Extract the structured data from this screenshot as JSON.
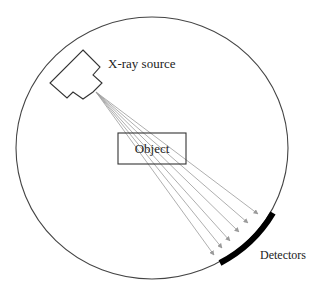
{
  "diagram": {
    "labels": {
      "source": "X-ray source",
      "object": "Object",
      "detectors": "Detectors"
    },
    "colors": {
      "outline": "#333333",
      "ray": "#9a9a9a",
      "detector": "#000000",
      "background": "#ffffff"
    },
    "gantry": {
      "cx": 152,
      "cy": 148,
      "rx": 136,
      "ry": 131
    },
    "source_origin": [
      96,
      92
    ],
    "ray_count": 6,
    "ray_endpoints": [
      [
        258,
        214
      ],
      [
        248,
        223
      ],
      [
        239,
        232
      ],
      [
        230,
        241
      ],
      [
        222,
        248
      ],
      [
        214,
        255
      ]
    ],
    "object_box": {
      "x": 118,
      "y": 133,
      "w": 68,
      "h": 31
    },
    "detector_arc": {
      "from": [
        273,
        213
      ],
      "to": [
        220,
        263
      ]
    }
  }
}
